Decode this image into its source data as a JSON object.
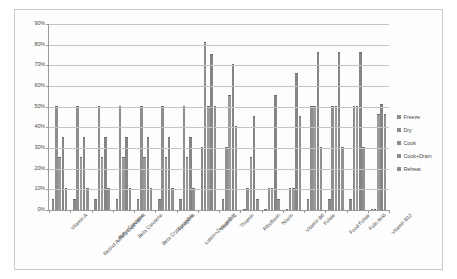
{
  "chart_data": {
    "type": "bar",
    "title": "",
    "xlabel": "",
    "ylabel": "",
    "ylim": [
      0,
      90
    ],
    "ytick_labels": [
      "90%",
      "80%",
      "70%",
      "60%",
      "50%",
      "40%",
      "30%",
      "20%",
      "10%",
      "0%"
    ],
    "ytick_values": [
      90,
      80,
      70,
      60,
      50,
      40,
      30,
      20,
      10,
      0
    ],
    "grid": true,
    "legend_position": "right",
    "categories": [
      "Vitamin A",
      "Retinol Activity Equivalent",
      "Alpha Carotene",
      "Beta Carotene",
      "Beta Cryptoxanthin",
      "Lycopene",
      "Lutein+Zeaxanthin",
      "Vitamin C",
      "Thiamin",
      "Riboflavin",
      "Niacin",
      "Vitamin B6",
      "Folate",
      "Food Folate",
      "Folic Acid",
      "Vitamin B12"
    ],
    "series": [
      {
        "name": "Freeze",
        "values": [
          5,
          5,
          5,
          5,
          5,
          5,
          5,
          30,
          5,
          0,
          0,
          0,
          5,
          5,
          5,
          0
        ]
      },
      {
        "name": "Dry",
        "values": [
          50,
          50,
          50,
          50,
          50,
          50,
          50,
          81,
          30,
          10,
          10,
          10,
          50,
          50,
          50,
          0
        ]
      },
      {
        "name": "Cook",
        "values": [
          25,
          25,
          25,
          25,
          25,
          25,
          25,
          50,
          55,
          25,
          10,
          10,
          50,
          50,
          50,
          46
        ]
      },
      {
        "name": "Cook+Drain",
        "values": [
          35,
          35,
          35,
          35,
          35,
          35,
          35,
          75,
          70,
          45,
          55,
          66,
          76,
          76,
          76,
          51
        ]
      },
      {
        "name": "Reheat",
        "values": [
          10,
          10,
          10,
          10,
          10,
          10,
          10,
          50,
          40,
          5,
          5,
          45,
          30,
          30,
          30,
          46
        ]
      }
    ]
  },
  "legend": {
    "items": [
      {
        "label": "Freeze"
      },
      {
        "label": "Dry"
      },
      {
        "label": "Cook"
      },
      {
        "label": "Cook+Drain"
      },
      {
        "label": "Reheat"
      }
    ]
  },
  "colors": {
    "bar": "#8b8b8b",
    "gridline": "#c4c4c4",
    "axis": "#9a9a9a",
    "text": "#4a4a4a",
    "background": "#fdfdfd",
    "border": "#c9c9c9"
  }
}
